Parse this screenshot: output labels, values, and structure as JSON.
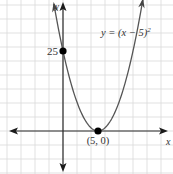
{
  "chart_data": {
    "type": "line",
    "title": "",
    "equation_label": "y = (x − 5)²",
    "equation_base": "y = (x − 5)",
    "equation_exp": "2",
    "xlabel": "x",
    "ylabel": "y",
    "grid": true,
    "series": [
      {
        "name": "y = (x − 5)^2",
        "function": "(x-5)^2",
        "x": [
          -1.3,
          -1,
          0,
          1,
          2,
          3,
          4,
          5,
          6,
          7,
          8,
          9,
          10,
          11,
          11.4
        ],
        "values": [
          39.7,
          36,
          25,
          16,
          9,
          4,
          1,
          0,
          1,
          4,
          9,
          16,
          25,
          36,
          41
        ]
      }
    ],
    "points": [
      {
        "x": 0,
        "y": 25,
        "label": "25"
      },
      {
        "x": 5,
        "y": 0,
        "label": "(5, 0)"
      }
    ],
    "xlim": [
      -9,
      15.7
    ],
    "ylim": [
      -13.4,
      41
    ]
  },
  "colors": {
    "grid": "#d9d9d9",
    "axis": "#2b2b2b",
    "curve": "#555555",
    "point": "#000000",
    "text": "#333333"
  }
}
